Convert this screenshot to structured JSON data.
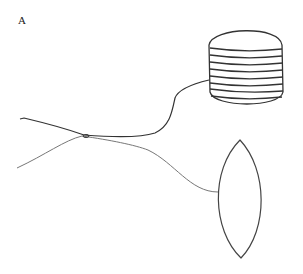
{
  "figure": {
    "panel_label": "A",
    "elements": [
      {
        "name": "spool",
        "type": "cylinder",
        "stripes": 8
      },
      {
        "name": "lens",
        "type": "lens-shape"
      },
      {
        "name": "dark-thread",
        "connects": "spool"
      },
      {
        "name": "gray-thread",
        "connects": "lens"
      },
      {
        "name": "knot",
        "type": "junction"
      }
    ],
    "colors": {
      "dark_line": "#333333",
      "gray_line": "#777777"
    }
  }
}
